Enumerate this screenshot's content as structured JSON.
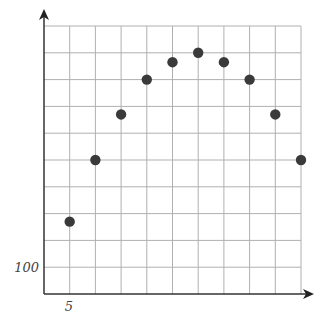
{
  "chart_data": {
    "type": "scatter",
    "title": "",
    "xlabel": "",
    "ylabel": "",
    "x": [
      5,
      10,
      15,
      20,
      25,
      30,
      35,
      40,
      45,
      50
    ],
    "y": [
      270,
      500,
      670,
      800,
      865,
      900,
      865,
      800,
      670,
      500
    ],
    "series": [
      {
        "name": "points",
        "x": [
          5,
          10,
          15,
          20,
          25,
          30,
          35,
          40,
          45,
          50
        ],
        "values": [
          270,
          500,
          670,
          800,
          865,
          900,
          865,
          800,
          670,
          500
        ]
      }
    ],
    "xlim": [
      0,
      50
    ],
    "ylim": [
      0,
      1000
    ],
    "x_grid_step": 5,
    "y_grid_step": 100,
    "grid": true,
    "legend": null,
    "tick_labels": {
      "x": [
        {
          "value": 5,
          "label": "5"
        }
      ],
      "y": [
        {
          "value": 100,
          "label": "100"
        }
      ]
    },
    "colors": {
      "point": "#3a3a3a",
      "grid": "#b0b0b0",
      "axis": "#333333",
      "label": "#444444"
    }
  },
  "labels": {
    "x_tick": "5",
    "y_tick": "100"
  }
}
